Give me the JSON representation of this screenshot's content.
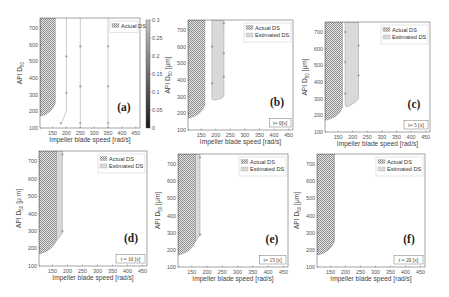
{
  "figure": {
    "colors": {
      "actual_ds_hatch": "#8c8c8c",
      "estimated_ds_fill": "#d9d9d9",
      "estimated_ds_edge": "#9a9a9a",
      "axes": "#4a4a4a",
      "contour_line": "#9a9a9a"
    }
  },
  "chart_data": [
    {
      "id": "a",
      "type": "area",
      "panel_label": "(a)",
      "title": "",
      "xlabel": "Impeller blade speed [rad/s]",
      "ylabel": {
        "main": "API D",
        "sub": "50",
        "unit": ""
      },
      "xlim": [
        105,
        465
      ],
      "ylim": [
        100,
        760
      ],
      "xticks": [
        150,
        200,
        250,
        300,
        350,
        400,
        450
      ],
      "yticks": [
        100,
        200,
        300,
        400,
        500,
        600,
        700
      ],
      "grid": false,
      "legend": {
        "position": "upper right",
        "entries": [
          "Actual DS"
        ]
      },
      "time_label": "",
      "colorbar": {
        "range": [
          0,
          0.3
        ],
        "ticks": [
          "0",
          "0.05",
          "0.1",
          "0.15",
          "0.2",
          "0.25",
          "0.3"
        ]
      },
      "actual_ds": [
        [
          105,
          760
        ],
        [
          160,
          760
        ],
        [
          160,
          250
        ],
        [
          152,
          222
        ],
        [
          140,
          198
        ],
        [
          125,
          182
        ],
        [
          112,
          174
        ],
        [
          105,
          172
        ]
      ],
      "estimated_ds": [],
      "lines": [
        [
          [
            180,
            125
          ],
          [
            190,
            160
          ],
          [
            200,
            200
          ],
          [
            200,
            760
          ]
        ],
        [
          [
            250,
            100
          ],
          [
            250,
            760
          ]
        ],
        [
          [
            350,
            100
          ],
          [
            350,
            760
          ]
        ]
      ],
      "markers": [
        [
          180,
          128
        ],
        [
          200,
          310
        ],
        [
          200,
          530
        ],
        [
          250,
          130
        ],
        [
          250,
          350
        ],
        [
          250,
          590
        ],
        [
          350,
          130
        ],
        [
          350,
          350
        ],
        [
          350,
          590
        ]
      ]
    },
    {
      "id": "b",
      "type": "area",
      "panel_label": "(b)",
      "xlabel": "Impeller blade speed [rad/s]",
      "ylabel": {
        "main": "API D",
        "sub": "50",
        "unit": " [μm]"
      },
      "xlim": [
        105,
        465
      ],
      "ylim": [
        100,
        760
      ],
      "xticks": [
        150,
        200,
        250,
        300,
        350,
        400,
        450
      ],
      "yticks": [
        100,
        200,
        300,
        400,
        500,
        600,
        700
      ],
      "grid": false,
      "legend": {
        "position": "upper right",
        "entries": [
          "Actual DS",
          "Estimated DS"
        ]
      },
      "time_label": "t= 0[s]",
      "actual_ds": [
        [
          105,
          760
        ],
        [
          163,
          760
        ],
        [
          163,
          250
        ],
        [
          155,
          222
        ],
        [
          142,
          198
        ],
        [
          127,
          182
        ],
        [
          112,
          173
        ],
        [
          105,
          171
        ]
      ],
      "estimated_ds": [
        [
          187,
          760
        ],
        [
          228,
          760
        ],
        [
          228,
          305
        ],
        [
          222,
          292
        ],
        [
          210,
          284
        ],
        [
          196,
          280
        ],
        [
          189,
          283
        ],
        [
          187,
          290
        ]
      ],
      "lines": [],
      "markers": [
        [
          228,
          740
        ],
        [
          228,
          560
        ],
        [
          228,
          420
        ],
        [
          187,
          600
        ],
        [
          187,
          380
        ]
      ]
    },
    {
      "id": "c",
      "type": "area",
      "panel_label": "(c)",
      "xlabel": "Impeller blade speed [rad/s]",
      "ylabel": {
        "main": "API D",
        "sub": "50",
        "unit": " [μm]"
      },
      "xlim": [
        105,
        465
      ],
      "ylim": [
        100,
        760
      ],
      "xticks": [
        150,
        200,
        250,
        300,
        350,
        400,
        450
      ],
      "yticks": [
        100,
        200,
        300,
        400,
        500,
        600,
        700
      ],
      "grid": false,
      "legend": {
        "position": "upper right",
        "entries": [
          "Actual DS",
          "Estimated DS"
        ]
      },
      "time_label": "t= 5 [s]",
      "actual_ds": [
        [
          105,
          760
        ],
        [
          165,
          760
        ],
        [
          165,
          250
        ],
        [
          157,
          222
        ],
        [
          144,
          198
        ],
        [
          128,
          182
        ],
        [
          113,
          173
        ],
        [
          105,
          171
        ]
      ],
      "estimated_ds": [
        [
          174,
          760
        ],
        [
          220,
          760
        ],
        [
          220,
          300
        ],
        [
          210,
          280
        ],
        [
          196,
          265
        ],
        [
          184,
          252
        ],
        [
          176,
          256
        ],
        [
          174,
          265
        ]
      ],
      "lines": [],
      "markers": [
        [
          174,
          700
        ],
        [
          174,
          520
        ],
        [
          220,
          620
        ],
        [
          220,
          440
        ],
        [
          174,
          330
        ]
      ]
    },
    {
      "id": "d",
      "type": "area",
      "panel_label": "(d)",
      "xlabel": "Impeller blade speed [rad/s]",
      "ylabel": {
        "main": "API D",
        "sub": "50",
        "unit": " [μ m]"
      },
      "xlim": [
        105,
        465
      ],
      "ylim": [
        100,
        760
      ],
      "xticks": [
        150,
        200,
        250,
        300,
        350,
        400,
        450
      ],
      "yticks": [
        100,
        200,
        300,
        400,
        500,
        600,
        700
      ],
      "grid": false,
      "legend": {
        "position": "upper right",
        "entries": [
          "Actual DS",
          "Estimated DS"
        ]
      },
      "time_label": "t = 10 [s]",
      "actual_ds": [
        [
          105,
          760
        ],
        [
          163,
          760
        ],
        [
          163,
          250
        ],
        [
          155,
          222
        ],
        [
          142,
          198
        ],
        [
          127,
          182
        ],
        [
          112,
          173
        ],
        [
          105,
          171
        ]
      ],
      "estimated_ds": [
        [
          105,
          760
        ],
        [
          183,
          760
        ],
        [
          183,
          290
        ],
        [
          170,
          258
        ],
        [
          150,
          220
        ],
        [
          130,
          192
        ],
        [
          112,
          175
        ],
        [
          105,
          172
        ]
      ],
      "lines": [],
      "markers": [
        [
          183,
          740
        ],
        [
          183,
          300
        ]
      ]
    },
    {
      "id": "e",
      "type": "area",
      "panel_label": "(e)",
      "xlabel": "Impeller blade speed [rad/s]",
      "ylabel": {
        "main": "API D",
        "sub": "50",
        "unit": " [μm]"
      },
      "xlim": [
        105,
        465
      ],
      "ylim": [
        100,
        760
      ],
      "xticks": [
        150,
        200,
        250,
        300,
        350,
        400,
        450
      ],
      "yticks": [
        100,
        200,
        300,
        400,
        500,
        600,
        700
      ],
      "grid": false,
      "legend": {
        "position": "upper right",
        "entries": [
          "Actual DS",
          "Estimated DS"
        ]
      },
      "time_label": "t= 15 [s]",
      "actual_ds": [
        [
          105,
          760
        ],
        [
          162,
          760
        ],
        [
          162,
          250
        ],
        [
          154,
          222
        ],
        [
          141,
          198
        ],
        [
          126,
          182
        ],
        [
          112,
          173
        ],
        [
          105,
          171
        ]
      ],
      "estimated_ds": [
        [
          105,
          760
        ],
        [
          177,
          760
        ],
        [
          177,
          285
        ],
        [
          165,
          255
        ],
        [
          148,
          220
        ],
        [
          130,
          192
        ],
        [
          112,
          175
        ],
        [
          105,
          172
        ]
      ],
      "lines": [],
      "markers": [
        [
          177,
          740
        ],
        [
          177,
          290
        ]
      ]
    },
    {
      "id": "f",
      "type": "area",
      "panel_label": "(f)",
      "xlabel": "Impeller blade speed [rad/s]",
      "ylabel": {
        "main": "API D",
        "sub": "50",
        "unit": " [μm]"
      },
      "xlim": [
        105,
        465
      ],
      "ylim": [
        100,
        760
      ],
      "xticks": [
        150,
        200,
        250,
        300,
        350,
        400,
        450
      ],
      "yticks": [
        100,
        200,
        300,
        400,
        500,
        600,
        700
      ],
      "grid": false,
      "legend": {
        "position": "upper right",
        "entries": [
          "Actual DS",
          "Estimated DS"
        ]
      },
      "time_label": "t = 20 [s]",
      "actual_ds": [
        [
          105,
          760
        ],
        [
          162,
          760
        ],
        [
          162,
          250
        ],
        [
          154,
          222
        ],
        [
          141,
          198
        ],
        [
          126,
          182
        ],
        [
          112,
          173
        ],
        [
          105,
          171
        ]
      ],
      "estimated_ds": [
        [
          105,
          760
        ],
        [
          163,
          760
        ],
        [
          163,
          252
        ],
        [
          155,
          223
        ],
        [
          142,
          199
        ],
        [
          127,
          183
        ],
        [
          112,
          174
        ],
        [
          105,
          172
        ]
      ],
      "lines": [],
      "markers": []
    }
  ]
}
